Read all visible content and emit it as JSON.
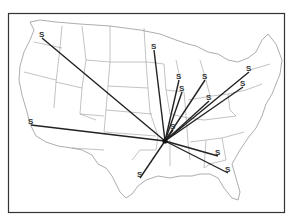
{
  "map": {
    "type": "route-map",
    "region": "United States",
    "marker_label": "S",
    "colors": {
      "route": "#222222",
      "border": "#9a9a9a",
      "frame": "#333333"
    },
    "hub": {
      "x": 165,
      "y": 141
    },
    "sites": [
      {
        "label": "S",
        "x": 42,
        "y": 38
      },
      {
        "label": "S",
        "x": 154,
        "y": 50
      },
      {
        "label": "S",
        "x": 179,
        "y": 80
      },
      {
        "label": "S",
        "x": 205,
        "y": 80
      },
      {
        "label": "S",
        "x": 182,
        "y": 92
      },
      {
        "label": "S",
        "x": 249,
        "y": 72
      },
      {
        "label": "S",
        "x": 243,
        "y": 87
      },
      {
        "label": "S",
        "x": 209,
        "y": 101
      },
      {
        "label": "S",
        "x": 31,
        "y": 125
      },
      {
        "label": "S",
        "x": 140,
        "y": 178
      },
      {
        "label": "S",
        "x": 218,
        "y": 156
      },
      {
        "label": "S",
        "x": 228,
        "y": 173
      },
      {
        "label": "S",
        "x": 173,
        "y": 130
      }
    ]
  }
}
